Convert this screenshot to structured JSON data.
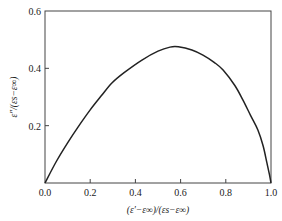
{
  "chart_data": {
    "type": "line",
    "title": "",
    "xlabel": "(ε′−ε∞)/(εs−ε∞)",
    "ylabel": "ε″/(εs−ε∞)",
    "xlim": [
      0.0,
      1.0
    ],
    "ylim": [
      0.0,
      0.6
    ],
    "x_ticks": [
      "0.0",
      "0.2",
      "0.4",
      "0.6",
      "0.8",
      "1.0"
    ],
    "y_ticks": [
      "0.2",
      "0.4",
      "0.6"
    ],
    "grid": false,
    "legend": null,
    "series": [
      {
        "name": "Cole-Cole arc",
        "color": "#222222",
        "x": [
          0.0,
          0.05,
          0.1,
          0.146,
          0.2,
          0.25,
          0.296,
          0.35,
          0.429,
          0.5,
          0.553,
          0.59,
          0.65,
          0.699,
          0.75,
          0.788,
          0.84,
          0.876,
          0.91,
          0.942,
          0.965,
          0.982,
          0.993,
          1.0
        ],
        "y": [
          0.0,
          0.075,
          0.14,
          0.195,
          0.255,
          0.305,
          0.349,
          0.385,
          0.429,
          0.46,
          0.474,
          0.475,
          0.464,
          0.446,
          0.42,
          0.394,
          0.34,
          0.289,
          0.235,
          0.185,
          0.13,
          0.07,
          0.03,
          0.0
        ]
      }
    ]
  }
}
